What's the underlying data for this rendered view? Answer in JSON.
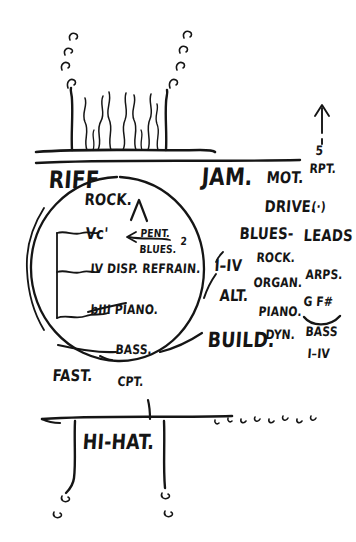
{
  "page": {
    "kind": "hand-drawn-sketch-note",
    "ink_color": "#151515",
    "paper_color": "#ffffff",
    "width": 356,
    "height": 542
  },
  "top_figure": {
    "name": "wavy-flame-with-bubbles",
    "description": "two vertical posts flanking wavy squiggle lines rising from a horizontal baseline, with small bubble dots arcing upward and outward on both sides"
  },
  "arrow_marker": {
    "glyph": "up-arrow",
    "number": "5",
    "label": "RPT."
  },
  "left_column": {
    "heading": "RIFF",
    "items": [
      {
        "label": "ROCK."
      },
      {
        "label": "Vc'"
      },
      {
        "label": "IV DISP. REFRAIN."
      },
      {
        "label": "bIII PIANO."
      },
      {
        "label": "BASS."
      }
    ],
    "caret": "∧",
    "callout": {
      "top": "PENT.",
      "number": "2",
      "bottom": "BLUES."
    },
    "bottom_notes": [
      {
        "label": "FAST."
      },
      {
        "label": "CPT."
      }
    ]
  },
  "center_column": {
    "heading": "JAM.",
    "items": [
      {
        "label": "I–IV"
      },
      {
        "label": "ALT."
      },
      {
        "label": "BUILD."
      }
    ]
  },
  "right_column_a": {
    "items": [
      {
        "label": "MOT."
      },
      {
        "label": "DRIVE."
      },
      {
        "label": "(·)"
      },
      {
        "label": "BLUES-"
      },
      {
        "label": "ROCK."
      },
      {
        "label": "ORGAN."
      },
      {
        "label": "PIANO."
      },
      {
        "label": "DYN."
      }
    ]
  },
  "right_column_b": {
    "items": [
      {
        "label": "LEADS"
      },
      {
        "label": "ARPS."
      },
      {
        "label": "G F#"
      },
      {
        "label": "BASS"
      },
      {
        "label": "I–IV"
      }
    ],
    "slur": "curved arc beneath G F#"
  },
  "bottom_section": {
    "label": "HI-HAT.",
    "description": "horizontal rule with two descending stems ending in small hook dots, plus a row of small tick/hook marks trailing to the right"
  }
}
